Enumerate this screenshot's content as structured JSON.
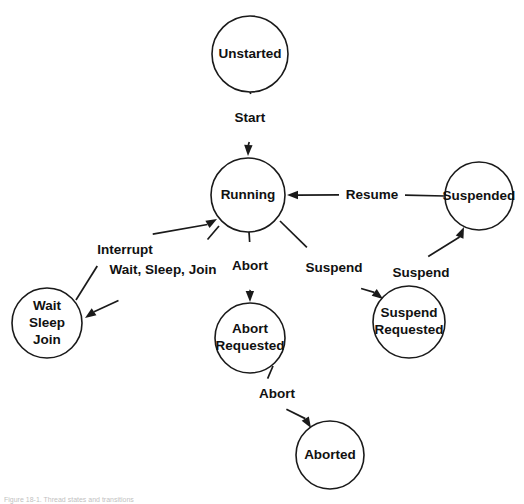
{
  "figure": {
    "caption": "Figure 18-1. Thread states and transitions",
    "background_color": "#ffffff",
    "stroke_color": "#1a1a1a",
    "text_color": "#111111"
  },
  "chart_data": {
    "type": "diagram",
    "title": "Thread states and transitions",
    "nodes": [
      {
        "id": "unstarted",
        "label": "Unstarted",
        "lines": [
          "Unstarted"
        ],
        "cx": 250,
        "cy": 54,
        "r": 38
      },
      {
        "id": "running",
        "label": "Running",
        "lines": [
          "Running"
        ],
        "cx": 248,
        "cy": 195,
        "r": 37
      },
      {
        "id": "suspended",
        "label": "Suspended",
        "lines": [
          "Suspended"
        ],
        "cx": 479,
        "cy": 196,
        "r": 34
      },
      {
        "id": "wait-sleep-join",
        "label": "Wait Sleep Join",
        "lines": [
          "Wait",
          "Sleep",
          "Join"
        ],
        "cx": 47,
        "cy": 323,
        "r": 35
      },
      {
        "id": "abort-requested",
        "label": "Abort Requested",
        "lines": [
          "Abort",
          "Requested"
        ],
        "cx": 250,
        "cy": 338,
        "r": 35
      },
      {
        "id": "suspend-requested",
        "label": "Suspend Requested",
        "lines": [
          "Suspend",
          "Requested"
        ],
        "cx": 409,
        "cy": 322,
        "r": 36
      },
      {
        "id": "aborted",
        "label": "Aborted",
        "lines": [
          "Aborted"
        ],
        "cx": 330,
        "cy": 455,
        "r": 34
      }
    ],
    "edges": [
      {
        "id": "start",
        "label": "Start",
        "from": "unstarted",
        "to": "running",
        "x1": 250,
        "y1": 92,
        "x2": 248,
        "y2": 156,
        "lx": 250,
        "ly": 118,
        "gap": 24
      },
      {
        "id": "resume",
        "label": "Resume",
        "from": "suspended",
        "to": "running",
        "x1": 445,
        "y1": 196,
        "x2": 287,
        "y2": 195,
        "lx": 372,
        "ly": 195,
        "gap": 33
      },
      {
        "id": "abort-running",
        "label": "Abort",
        "from": "running",
        "to": "abort-requested",
        "x1": 249,
        "y1": 232,
        "x2": 250,
        "y2": 302,
        "lx": 250,
        "ly": 266,
        "gap": 24
      },
      {
        "id": "suspend-running",
        "label": "Suspend",
        "from": "running",
        "to": "suspend-requested",
        "x1": 280,
        "y1": 221,
        "x2": 383,
        "y2": 299,
        "lx": 334,
        "ly": 268,
        "gap": 34
      },
      {
        "id": "interrupt",
        "label": "Interrupt",
        "from": "wait-sleep-join",
        "to": "running",
        "x1": 76,
        "y1": 300,
        "x2": 217,
        "y2": 219,
        "lx": 125,
        "ly": 250,
        "gap": 32
      },
      {
        "id": "wait-sleep-join-t",
        "label": "Wait, Sleep, Join",
        "from": "running",
        "to": "wait-sleep-join",
        "x1": 219,
        "y1": 226,
        "x2": 85,
        "y2": 318,
        "lx": 163,
        "ly": 270,
        "gap": 54
      },
      {
        "id": "suspend-pending",
        "label": "Suspend",
        "from": "suspend-requested",
        "to": "suspended",
        "x1": 433,
        "y1": 298,
        "x2": 464,
        "y2": 227,
        "lx": 421,
        "ly": 273,
        "gap": 18
      },
      {
        "id": "abort-final",
        "label": "Abort",
        "from": "abort-requested",
        "to": "aborted",
        "x1": 273,
        "y1": 366,
        "x2": 311,
        "y2": 428,
        "lx": 277,
        "ly": 394,
        "gap": 18
      }
    ],
    "arrowhead": {
      "length": 11,
      "half_width": 4.2
    }
  }
}
